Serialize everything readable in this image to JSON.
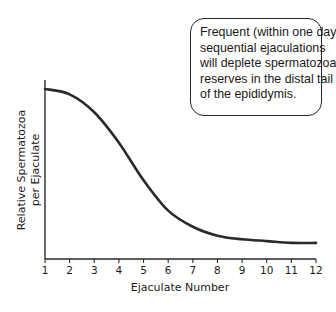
{
  "chart_data": {
    "type": "line",
    "title": "",
    "xlabel": "Ejaculate Number",
    "ylabel_lines": [
      "Relative Spermatozoa",
      "per Ejaculate"
    ],
    "ylabel": "Relative Spermatozoa per Ejaculate",
    "x": [
      1,
      2,
      3,
      4,
      5,
      6,
      7,
      8,
      9,
      10,
      11,
      12
    ],
    "x_tick_labels": [
      "1",
      "2",
      "3",
      "4",
      "5",
      "6",
      "7",
      "8",
      "9",
      "10",
      "11",
      "12"
    ],
    "xlim": [
      1,
      12
    ],
    "ylim": [
      0,
      1
    ],
    "y_ticks_shown": false,
    "grid": false,
    "legend": "none",
    "series": [
      {
        "name": "Relative spermatozoa",
        "values": [
          0.95,
          0.92,
          0.82,
          0.65,
          0.44,
          0.27,
          0.18,
          0.13,
          0.11,
          0.1,
          0.09,
          0.09
        ]
      }
    ],
    "annotations": [
      {
        "type": "callout-box",
        "position": "top-right",
        "lines": [
          "Frequent (within one day)",
          "sequential ejaculations",
          "will deplete spermatozoal",
          "reserves in the distal tail",
          "of the epididymis."
        ]
      }
    ]
  },
  "colors": {
    "line": "#2a2a2a",
    "axis": "#2a2a2a",
    "text": "#1a1a1a",
    "background": "#ffffff"
  }
}
